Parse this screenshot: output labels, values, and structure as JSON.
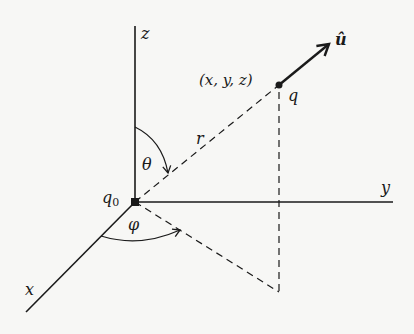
{
  "diagram": {
    "type": "spherical-coordinates-3d",
    "colors": {
      "ink": "#1a1a1a",
      "background": "#f7f7f5"
    },
    "axes": {
      "z": {
        "label": "z"
      },
      "y": {
        "label": "y"
      },
      "x": {
        "label": "x"
      }
    },
    "points": {
      "origin": {
        "label": "q",
        "subscript": "0"
      },
      "target": {
        "label": "q",
        "coords_label": "(x, y, z)"
      }
    },
    "vectors": {
      "unit": {
        "label": "û"
      }
    },
    "segments": {
      "radius": {
        "label": "r"
      }
    },
    "angles": {
      "polar": {
        "label": "θ"
      },
      "azimuth": {
        "label": "φ"
      }
    }
  }
}
